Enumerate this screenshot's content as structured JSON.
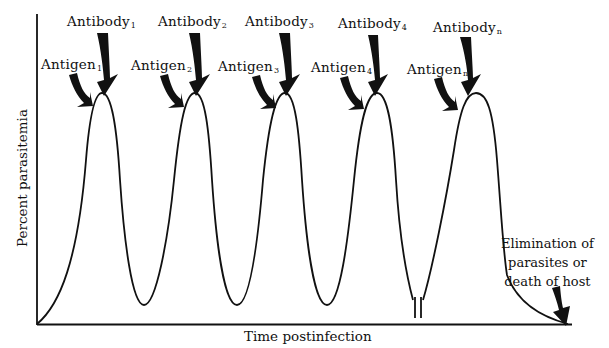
{
  "diagram": {
    "type": "parasitemia-waves",
    "y_axis_label": "Percent parasitemia",
    "x_axis_label": "Time postinfection",
    "waves": [
      {
        "antigen": "Antigen",
        "antigen_sub": "1",
        "antibody": "Antibody",
        "antibody_sub": "1"
      },
      {
        "antigen": "Antigen",
        "antigen_sub": "2",
        "antibody": "Antibody",
        "antibody_sub": "2"
      },
      {
        "antigen": "Antigen",
        "antigen_sub": "3",
        "antibody": "Antibody",
        "antibody_sub": "3"
      },
      {
        "antigen": "Antigen",
        "antigen_sub": "4",
        "antibody": "Antibody",
        "antibody_sub": "4"
      },
      {
        "antigen": "Antigen",
        "antigen_sub": "n",
        "antibody": "Antibody",
        "antibody_sub": "n"
      }
    ],
    "outcome": {
      "line1": "Elimination of",
      "line2": "parasites or",
      "line3": "death of host"
    },
    "axis_break": "||",
    "colors": {
      "ink": "#111111",
      "background": "#ffffff"
    }
  }
}
